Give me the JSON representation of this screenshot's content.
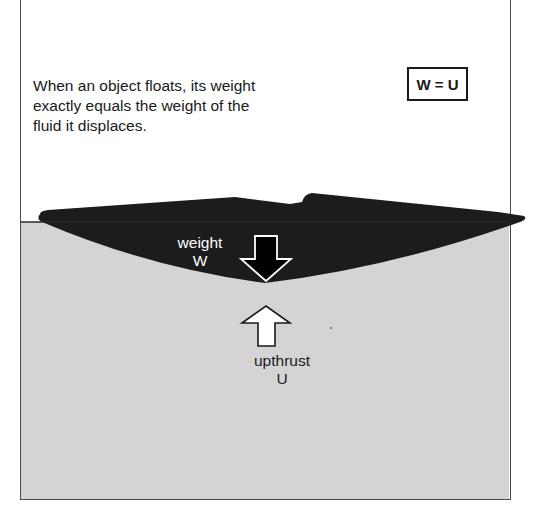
{
  "diagram": {
    "caption": {
      "lines": [
        "When an object floats, its weight",
        "exactly equals the weight of the",
        "fluid it displaces."
      ]
    },
    "equation": "W = U",
    "forces": {
      "weight": {
        "label": "weight",
        "symbol": "W",
        "direction": "down",
        "icon": "arrow-down-icon"
      },
      "upthrust": {
        "label": "upthrust",
        "symbol": "U",
        "direction": "up",
        "icon": "arrow-up-icon"
      }
    },
    "colors": {
      "fluid": "#d4d4d4",
      "object": "#1c1c1c",
      "frame": "#4a4a4a",
      "background": "#ffffff"
    }
  }
}
